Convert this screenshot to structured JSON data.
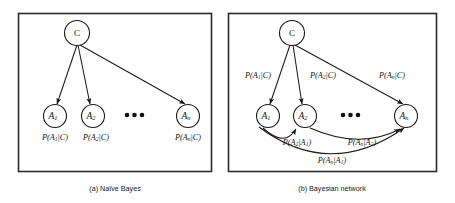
{
  "figure": {
    "background_color": "#ffffff",
    "stroke_color": "#1a1a1a",
    "border_color": "#2b2b2b"
  },
  "panels": [
    {
      "id": "naive-bayes",
      "caption": "(a) Naïve Bayes",
      "class_node": {
        "label": "C"
      },
      "attribute_nodes": [
        {
          "label": "A",
          "subscript": "1"
        },
        {
          "label": "A",
          "subscript": "2"
        },
        {
          "label": "A",
          "subscript": "n"
        }
      ],
      "ellipsis": "•••",
      "node_probabilities": [
        {
          "prefix": "P(A",
          "sub": "1",
          "suffix": "|C)"
        },
        {
          "prefix": "P(A",
          "sub": "2",
          "suffix": "|C)"
        },
        {
          "prefix": "P(A",
          "sub": "n",
          "suffix": "|C)"
        }
      ],
      "edges": [
        {
          "from": "C",
          "to": "A1"
        },
        {
          "from": "C",
          "to": "A2"
        },
        {
          "from": "C",
          "to": "An"
        }
      ]
    },
    {
      "id": "bayesian-network",
      "caption": "(b) Bayesian network",
      "class_node": {
        "label": "C"
      },
      "attribute_nodes": [
        {
          "label": "A",
          "subscript": "1"
        },
        {
          "label": "A",
          "subscript": "2"
        },
        {
          "label": "A",
          "subscript": "n"
        }
      ],
      "ellipsis": "•••",
      "class_edge_labels": [
        {
          "prefix": "P(A",
          "sub": "1",
          "suffix": "|C)"
        },
        {
          "prefix": "P(A",
          "sub": "2",
          "suffix": "|C)"
        },
        {
          "prefix": "P(A",
          "sub": "n",
          "suffix": "|C)"
        }
      ],
      "chain_edge_labels": [
        {
          "prefix": "P(A",
          "sub": "2",
          "mid": "|A",
          "sub2": "1",
          "suffix": ")"
        },
        {
          "prefix": "P(A",
          "sub": "n",
          "mid": "|A",
          "sub2": "2",
          "suffix": ")"
        },
        {
          "prefix": "P(A",
          "sub": "n",
          "mid": "|A",
          "sub2": "1",
          "suffix": ")"
        }
      ],
      "edges": [
        {
          "from": "C",
          "to": "A1"
        },
        {
          "from": "C",
          "to": "A2"
        },
        {
          "from": "C",
          "to": "An"
        },
        {
          "from": "A1",
          "to": "A2"
        },
        {
          "from": "A2",
          "to": "An"
        },
        {
          "from": "A1",
          "to": "An"
        }
      ]
    }
  ]
}
